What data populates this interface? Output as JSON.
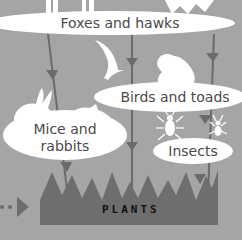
{
  "diagram": {
    "colors": {
      "background": "#a5a5a5",
      "bubble": "#ffffff",
      "arrow": "#6b6b6b",
      "plants": "#6e6e6e",
      "text": "#4a4a4a",
      "plants_text": "#111111"
    },
    "nodes": [
      {
        "id": "foxes_hawks",
        "label": "Foxes and hawks"
      },
      {
        "id": "birds_toads",
        "label": "Birds and toads"
      },
      {
        "id": "mice_rabbits",
        "label_line1": "Mice and",
        "label_line2": "rabbits"
      },
      {
        "id": "insects",
        "label": "Insects"
      },
      {
        "id": "plants",
        "label": "PLANTS"
      }
    ],
    "icons": [
      "fox-silhouette",
      "hawk-silhouette",
      "swallow-bird-icon",
      "toad-icon",
      "rabbit-icon",
      "mouse-icon",
      "beetle-icon",
      "ant-icon"
    ]
  }
}
